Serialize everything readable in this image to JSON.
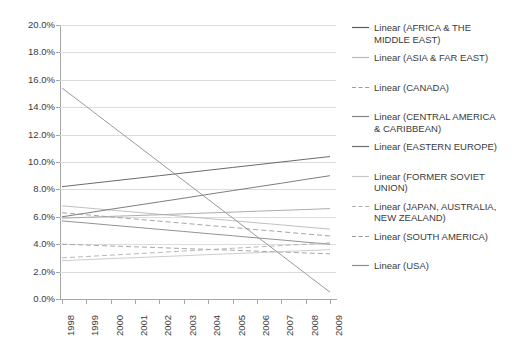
{
  "chart_data": {
    "type": "line",
    "title": "",
    "subtitle": "",
    "xlabel": "",
    "ylabel": "",
    "x": [
      1998,
      1999,
      2000,
      2001,
      2002,
      2003,
      2004,
      2005,
      2006,
      2007,
      2008,
      2009
    ],
    "x_tick_labels": [
      "1998",
      "1999",
      "2000",
      "2001",
      "2002",
      "2003",
      "2004",
      "2005",
      "2006",
      "2007",
      "2008",
      "2009"
    ],
    "y_tick_labels": [
      "20.0%",
      "18.0%",
      "16.0%",
      "14.0%",
      "12.0%",
      "10.0%",
      "8.0%",
      "6.0%",
      "4.0%",
      "2.0%",
      "0.0%"
    ],
    "y_tick_values": [
      20.0,
      18.0,
      16.0,
      14.0,
      12.0,
      10.0,
      8.0,
      6.0,
      4.0,
      2.0,
      0.0
    ],
    "ylim": [
      0.0,
      20.0
    ],
    "y_unit": "percent",
    "grid": true,
    "legend_position": "right",
    "note": "Each series is a straight linear trendline defined by its 1998 and 2009 endpoint values (percent).",
    "series": [
      {
        "name": "Linear (AFRICA & THE MIDDLE EAST)",
        "region": "AFRICA & THE MIDDLE EAST",
        "style": "solid",
        "color": "#59595b",
        "start_value": 8.2,
        "end_value": 10.4,
        "values": [
          8.2,
          8.4,
          8.6,
          8.8,
          9.0,
          9.2,
          9.4,
          9.6,
          9.8,
          10.0,
          10.2,
          10.4
        ]
      },
      {
        "name": "Linear (ASIA & FAR EAST)",
        "region": "ASIA & FAR EAST",
        "style": "solid",
        "color": "#b9b9bb",
        "start_value": 6.8,
        "end_value": 5.1,
        "values": [
          6.8,
          6.65,
          6.49,
          6.34,
          6.18,
          6.03,
          5.87,
          5.72,
          5.56,
          5.41,
          5.25,
          5.1
        ]
      },
      {
        "name": "Linear (CANADA)",
        "region": "CANADA",
        "style": "dashed",
        "color": "#9d9da0",
        "start_value": 4.0,
        "end_value": 3.3,
        "values": [
          4.0,
          3.94,
          3.87,
          3.81,
          3.75,
          3.68,
          3.62,
          3.56,
          3.49,
          3.43,
          3.36,
          3.3
        ]
      },
      {
        "name": "Linear (CENTRAL AMERICA & CARIBBEAN)",
        "region": "CENTRAL AMERICA & CARIBBEAN",
        "style": "solid",
        "color": "#86868a",
        "start_value": 5.7,
        "end_value": 4.0,
        "values": [
          5.7,
          5.55,
          5.39,
          5.24,
          5.08,
          4.93,
          4.77,
          4.62,
          4.46,
          4.31,
          4.15,
          4.0
        ]
      },
      {
        "name": "Linear (EASTERN EUROPE)",
        "region": "EASTERN EUROPE",
        "style": "solid",
        "color": "#6e6e71",
        "start_value": 6.0,
        "end_value": 9.0,
        "values": [
          6.0,
          6.27,
          6.55,
          6.82,
          7.09,
          7.36,
          7.64,
          7.91,
          8.18,
          8.45,
          8.73,
          9.0
        ]
      },
      {
        "name": "Linear (FORMER SOVIET UNION)",
        "region": "FORMER SOVIET UNION",
        "style": "solid",
        "color": "#c6c6c8",
        "start_value": 2.8,
        "end_value": 3.6,
        "values": [
          2.8,
          2.87,
          2.95,
          3.02,
          3.09,
          3.16,
          3.24,
          3.31,
          3.38,
          3.45,
          3.53,
          3.6
        ]
      },
      {
        "name": "Linear (JAPAN, AUSTRALIA, NEW ZEALAND)",
        "region": "JAPAN, AUSTRALIA, NEW ZEALAND",
        "style": "dashed",
        "color": "#aeaeb1",
        "start_value": 3.0,
        "end_value": 4.1,
        "values": [
          3.0,
          3.1,
          3.2,
          3.3,
          3.4,
          3.5,
          3.6,
          3.7,
          3.8,
          3.9,
          4.0,
          4.1
        ]
      },
      {
        "name": "Linear (SOUTH AMERICA)",
        "region": "SOUTH AMERICA",
        "style": "dashed",
        "color": "#9a9a9d",
        "start_value": 6.3,
        "end_value": 4.6,
        "values": [
          6.3,
          6.15,
          5.99,
          5.84,
          5.68,
          5.53,
          5.37,
          5.22,
          5.06,
          4.91,
          4.75,
          4.6
        ]
      },
      {
        "name": "Linear (USA)",
        "region": "USA",
        "style": "solid",
        "color": "#8d8d90",
        "start_value": 15.4,
        "end_value": 0.5,
        "values": [
          15.4,
          14.05,
          12.69,
          11.34,
          9.98,
          8.63,
          7.27,
          5.92,
          4.56,
          3.21,
          1.85,
          0.5
        ]
      },
      {
        "name": "Linear (WESTERN EUROPE)",
        "region": "WESTERN EUROPE",
        "style": "solid",
        "color": "#a3a3a6",
        "start_value": 5.9,
        "end_value": 6.6,
        "values": [
          5.9,
          5.96,
          6.03,
          6.09,
          6.15,
          6.22,
          6.28,
          6.34,
          6.41,
          6.47,
          6.53,
          6.6
        ]
      }
    ]
  },
  "legend": {
    "items": [
      {
        "label": "Linear (AFRICA & THE MIDDLE EAST)",
        "swatch": "line-swatch-solid-dark",
        "gap_after": 7
      },
      {
        "label": "Linear (ASIA & FAR EAST)",
        "swatch": "line-swatch-solid-light",
        "gap_after": 18
      },
      {
        "label": "Linear (CANADA)",
        "swatch": "line-swatch-dashed",
        "gap_after": 18
      },
      {
        "label": "Linear (CENTRAL AMERICA & CARIBBEAN)",
        "swatch": "line-swatch-solid-mid",
        "gap_after": 7
      },
      {
        "label": "Linear (EASTERN EUROPE)",
        "swatch": "line-swatch-solid-dark",
        "gap_after": 18
      },
      {
        "label": "Linear (FORMER SOVIET UNION)",
        "swatch": "line-swatch-solid-pale",
        "gap_after": 7
      },
      {
        "label": "Linear (JAPAN, AUSTRALIA, NEW ZEALAND)",
        "swatch": "line-swatch-dashed",
        "gap_after": 7
      },
      {
        "label": "Linear (SOUTH AMERICA)",
        "swatch": "line-swatch-dashed",
        "gap_after": 18
      },
      {
        "label": "Linear (USA)",
        "swatch": "line-swatch-solid-mid",
        "gap_after": 0
      }
    ]
  },
  "colors": {
    "axis": "#a6a6a6",
    "gridline": "#dcdcdc",
    "text": "#3b3b3b",
    "background": "#ffffff"
  }
}
